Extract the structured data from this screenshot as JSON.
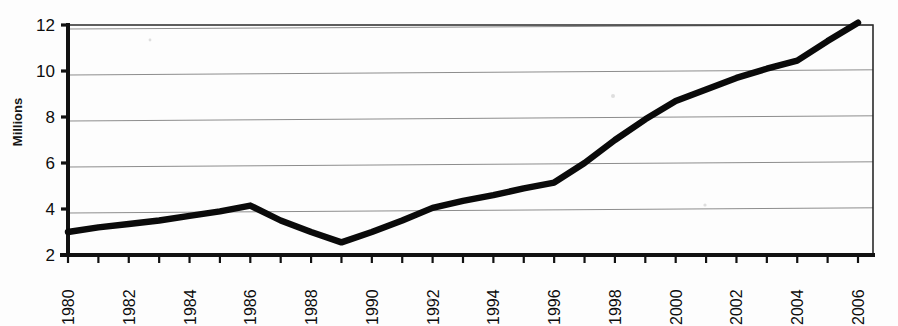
{
  "chart_data": {
    "type": "line",
    "title": "",
    "xlabel": "",
    "ylabel": "Millions",
    "x": [
      1980,
      1981,
      1982,
      1983,
      1984,
      1985,
      1986,
      1987,
      1988,
      1989,
      1990,
      1991,
      1992,
      1993,
      1994,
      1995,
      1996,
      1997,
      1998,
      1999,
      2000,
      2001,
      2002,
      2003,
      2004,
      2005,
      2006
    ],
    "values": [
      3.0,
      3.2,
      3.35,
      3.5,
      3.7,
      3.9,
      4.15,
      3.5,
      3.0,
      2.55,
      3.0,
      3.5,
      4.05,
      4.35,
      4.6,
      4.9,
      5.15,
      6.0,
      7.0,
      7.9,
      8.7,
      9.2,
      9.7,
      10.1,
      10.45,
      11.3,
      12.1
    ],
    "series": [
      {
        "name": "Millions",
        "values": [
          3.0,
          3.2,
          3.35,
          3.5,
          3.7,
          3.9,
          4.15,
          3.5,
          3.0,
          2.55,
          3.0,
          3.5,
          4.05,
          4.35,
          4.6,
          4.9,
          5.15,
          6.0,
          7.0,
          7.9,
          8.7,
          9.2,
          9.7,
          10.1,
          10.45,
          11.3,
          12.1
        ]
      }
    ],
    "xlim": [
      1980,
      2006
    ],
    "ylim": [
      2,
      12
    ],
    "ytick_labels": [
      "2",
      "4",
      "6",
      "8",
      "10",
      "12"
    ],
    "ytick_values": [
      2,
      4,
      6,
      8,
      10,
      12
    ],
    "xtick_values": [
      1980,
      1981,
      1982,
      1983,
      1984,
      1985,
      1986,
      1987,
      1988,
      1989,
      1990,
      1991,
      1992,
      1993,
      1994,
      1995,
      1996,
      1997,
      1998,
      1999,
      2000,
      2001,
      2002,
      2003,
      2004,
      2005,
      2006
    ],
    "xtick_labels": [
      "1980",
      "1982",
      "1984",
      "1986",
      "1988",
      "1990",
      "1992",
      "1994",
      "1996",
      "1998",
      "2000",
      "2002",
      "2004",
      "2006"
    ],
    "xtick_label_values": [
      1980,
      1982,
      1984,
      1986,
      1988,
      1990,
      1992,
      1994,
      1996,
      1998,
      2000,
      2002,
      2004,
      2006
    ],
    "xtick_label_rotation": -90,
    "grid": true,
    "grid_axis": "y",
    "legend": false,
    "legend_position": "none",
    "line_color": "#0a0a0a",
    "grid_color": "#8d8d8d",
    "axis_color": "#111111",
    "background_color": "#fdfdfd"
  }
}
